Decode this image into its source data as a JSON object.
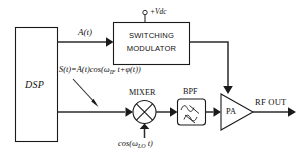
{
  "diagram": {
    "stroke_color": "#1a1a1a",
    "background_color": "#ffffff",
    "blocks": {
      "dsp": {
        "label": "DSP"
      },
      "switching_modulator": {
        "line1": "SWITCHING",
        "line2": "MODULATOR"
      },
      "mixer": {
        "label": "MIXER"
      },
      "bpf": {
        "label": "BPF"
      },
      "pa": {
        "label": "PA"
      }
    },
    "signals": {
      "amplitude_path": "A(t)",
      "phase_path_prefix": "S(t)=A(t)cos(ω",
      "phase_path_sub": "IF",
      "phase_path_suffix": " t+φ(t))",
      "lo_prefix": "cos(ω",
      "lo_sub": "LO",
      "lo_suffix": " t)",
      "supply": "+Vdc",
      "output": "RF OUT"
    }
  }
}
